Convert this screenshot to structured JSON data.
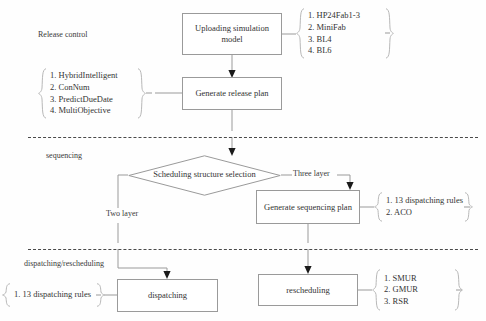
{
  "diagram": {
    "stage_labels": [
      {
        "text": "Release control"
      },
      {
        "text": "sequencing"
      },
      {
        "text": "dispatching/rescheduling"
      }
    ],
    "nodes": [
      {
        "id": "upload",
        "label": "Uploading simulation model",
        "shape": "rect"
      },
      {
        "id": "release_plan",
        "label": "Generate release plan",
        "shape": "rect"
      },
      {
        "id": "structure_selection",
        "label": "Scheduling structure selection",
        "shape": "diamond"
      },
      {
        "id": "sequencing_plan",
        "label": "Generate sequencing plan",
        "shape": "rect"
      },
      {
        "id": "dispatching",
        "label": "dispatching",
        "shape": "rect"
      },
      {
        "id": "rescheduling",
        "label": "rescheduling",
        "shape": "rect"
      }
    ],
    "edge_labels": [
      {
        "id": "three_layer",
        "text": "Three layer"
      },
      {
        "id": "two_layer",
        "text": "Two layer"
      }
    ],
    "option_lists": [
      {
        "id": "model-options",
        "side": "right",
        "items": [
          "1.  HP24Fab1-3",
          "2.  MiniFab",
          "3.  BL4",
          "4.  BL6"
        ]
      },
      {
        "id": "release-algorithm-options",
        "side": "left",
        "items": [
          "1.  HybridIntelligent",
          "2.  ConNum",
          "3.  PredictDueDate",
          "4.  MultiObjective"
        ]
      },
      {
        "id": "sequencing-algorithm-options",
        "side": "right",
        "items": [
          "1.  13 dispatching rules",
          "2.  ACO"
        ]
      },
      {
        "id": "dispatching-rule-options",
        "side": "left",
        "items": [
          "1.  13 dispatching rules"
        ]
      },
      {
        "id": "rescheduling-method-options",
        "side": "right",
        "items": [
          "1.  SMUR",
          "2.  GMUR",
          "3.  RSR"
        ]
      }
    ],
    "colors": {
      "box_border": "#9a9a9a",
      "text": "#333333",
      "separator": "#4a4a4a",
      "arrow": "#1a1a1a"
    }
  }
}
